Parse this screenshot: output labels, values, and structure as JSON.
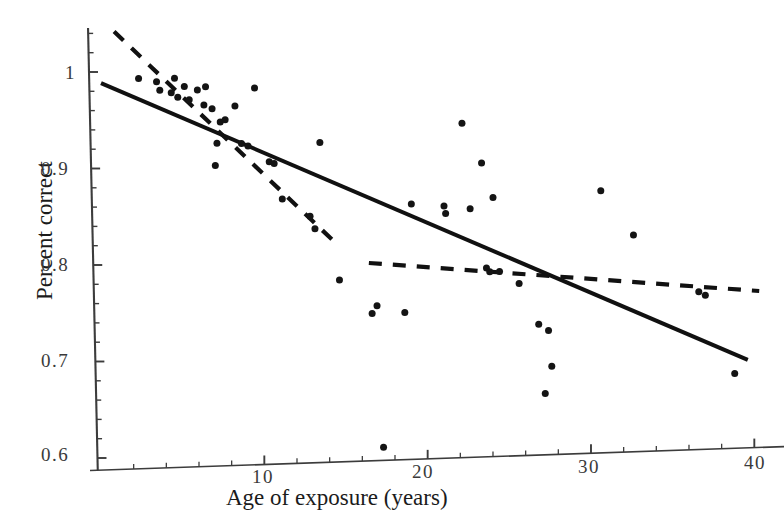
{
  "figure": {
    "axis_color": "#3c3c3c",
    "point_color": "#141414",
    "solid_line_color": "#111111",
    "dashed_line_color": "#111111",
    "background": "#ffffff"
  },
  "axes": {
    "xlabel": "Age of exposure (years)",
    "ylabel": "Percent correct",
    "xticks": [
      "10",
      "20",
      "30",
      "40"
    ],
    "yticks": [
      "1",
      "0.9",
      "0.8",
      "0.7",
      "0.6"
    ]
  },
  "chart_data": {
    "type": "scatter",
    "title": "",
    "xlabel": "Age of exposure (years)",
    "ylabel": "Percent correct",
    "xlim": [
      0,
      40.5
    ],
    "ylim": [
      0.595,
      1.045
    ],
    "xticks": [
      10,
      20,
      30,
      40
    ],
    "yticks": [
      1.0,
      0.9,
      0.8,
      0.7,
      0.6
    ],
    "minor_tick_step_x": 2,
    "minor_tick_step_y": 0.02,
    "grid": false,
    "legend": null,
    "points": [
      {
        "x": 2.3,
        "y": 0.992
      },
      {
        "x": 3.4,
        "y": 0.988
      },
      {
        "x": 3.6,
        "y": 0.979
      },
      {
        "x": 4.3,
        "y": 0.976
      },
      {
        "x": 4.5,
        "y": 0.991
      },
      {
        "x": 4.7,
        "y": 0.971
      },
      {
        "x": 5.1,
        "y": 0.982
      },
      {
        "x": 5.4,
        "y": 0.968
      },
      {
        "x": 5.9,
        "y": 0.978
      },
      {
        "x": 6.3,
        "y": 0.962
      },
      {
        "x": 6.4,
        "y": 0.981
      },
      {
        "x": 6.8,
        "y": 0.958
      },
      {
        "x": 7.0,
        "y": 0.899
      },
      {
        "x": 7.1,
        "y": 0.922
      },
      {
        "x": 7.3,
        "y": 0.944
      },
      {
        "x": 7.6,
        "y": 0.946
      },
      {
        "x": 8.2,
        "y": 0.96
      },
      {
        "x": 8.6,
        "y": 0.921
      },
      {
        "x": 9.0,
        "y": 0.918
      },
      {
        "x": 9.4,
        "y": 0.978
      },
      {
        "x": 10.3,
        "y": 0.901
      },
      {
        "x": 10.6,
        "y": 0.899
      },
      {
        "x": 11.1,
        "y": 0.862
      },
      {
        "x": 12.8,
        "y": 0.843
      },
      {
        "x": 13.1,
        "y": 0.83
      },
      {
        "x": 13.4,
        "y": 0.919
      },
      {
        "x": 14.6,
        "y": 0.776
      },
      {
        "x": 16.6,
        "y": 0.74
      },
      {
        "x": 16.9,
        "y": 0.748
      },
      {
        "x": 17.3,
        "y": 0.601
      },
      {
        "x": 18.6,
        "y": 0.74
      },
      {
        "x": 19.0,
        "y": 0.852
      },
      {
        "x": 21.0,
        "y": 0.849
      },
      {
        "x": 21.1,
        "y": 0.841
      },
      {
        "x": 22.1,
        "y": 0.934
      },
      {
        "x": 22.6,
        "y": 0.845
      },
      {
        "x": 23.3,
        "y": 0.892
      },
      {
        "x": 23.6,
        "y": 0.783
      },
      {
        "x": 23.8,
        "y": 0.779
      },
      {
        "x": 24.0,
        "y": 0.856
      },
      {
        "x": 24.4,
        "y": 0.779
      },
      {
        "x": 25.6,
        "y": 0.766
      },
      {
        "x": 26.8,
        "y": 0.723
      },
      {
        "x": 27.2,
        "y": 0.651
      },
      {
        "x": 27.4,
        "y": 0.716
      },
      {
        "x": 27.6,
        "y": 0.679
      },
      {
        "x": 30.6,
        "y": 0.859
      },
      {
        "x": 32.6,
        "y": 0.812
      },
      {
        "x": 36.6,
        "y": 0.751
      },
      {
        "x": 37.0,
        "y": 0.747
      },
      {
        "x": 38.8,
        "y": 0.665
      }
    ],
    "series": [
      {
        "name": "solid regression line",
        "style": "solid",
        "x": [
          0.0,
          39.6
        ],
        "y": [
          0.9885,
          0.6785
        ]
      },
      {
        "name": "dashed segment (early exposure)",
        "style": "dashed",
        "x": [
          0.8,
          14.3
        ],
        "y": [
          1.0415,
          0.8155
        ]
      },
      {
        "name": "dashed segment (late exposure)",
        "style": "dashed",
        "x": [
          16.4,
          40.3
        ],
        "y": [
          0.7925,
          0.7495
        ]
      }
    ]
  }
}
